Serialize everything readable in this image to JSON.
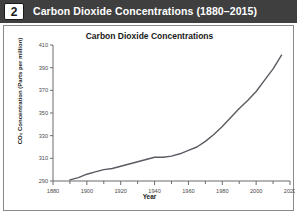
{
  "header": {
    "number": "2",
    "title": "Carbon Dioxide Concentrations (1880–2015)"
  },
  "chart_data": {
    "type": "line",
    "title": "Carbon Dioxide Concentrations",
    "xlabel": "Year",
    "ylabel": "CO₂ Concentration (Parts per million)",
    "xlim": [
      1880,
      2020
    ],
    "ylim": [
      290,
      410
    ],
    "xticks": [
      1880,
      1900,
      1920,
      1940,
      1960,
      1980,
      2000,
      2020
    ],
    "xtick_labels": [
      "1880",
      "1900",
      "1920",
      "1940",
      "1960",
      "1980",
      "2000",
      "2020"
    ],
    "xminor_step": 10,
    "yticks": [
      290,
      310,
      330,
      350,
      370,
      390,
      410
    ],
    "ytick_labels": [
      "290",
      "310",
      "330",
      "350",
      "370",
      "390",
      "410"
    ],
    "grid": false,
    "legend": false,
    "line_color": "#5a5a62",
    "series": [
      {
        "name": "CO₂ Concentration",
        "x": [
          1890,
          1895,
          1900,
          1905,
          1910,
          1915,
          1920,
          1925,
          1930,
          1935,
          1940,
          1945,
          1950,
          1955,
          1960,
          1965,
          1970,
          1975,
          1980,
          1985,
          1990,
          1995,
          2000,
          2005,
          2010,
          2015
        ],
        "values": [
          291,
          293,
          296,
          298,
          300,
          301,
          303,
          305,
          307,
          309,
          311,
          311,
          312,
          314,
          317,
          320,
          325,
          331,
          338,
          346,
          354,
          361,
          369,
          379,
          389,
          401
        ]
      }
    ]
  }
}
